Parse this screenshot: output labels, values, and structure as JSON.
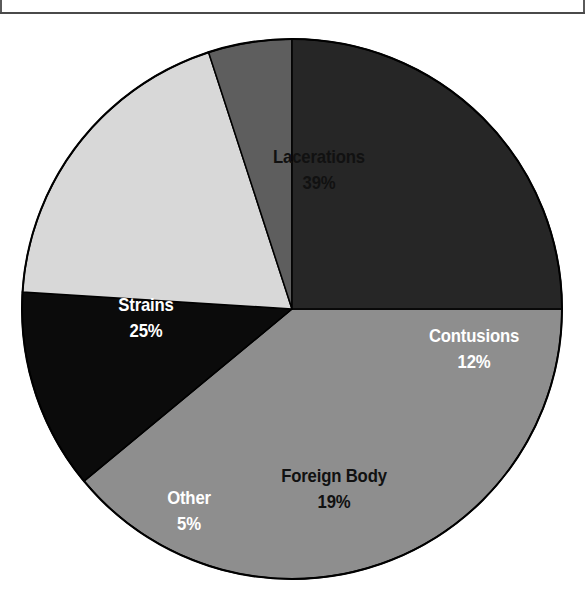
{
  "page": {
    "background_color": "#ffffff",
    "rule_color": "#4a4a4a"
  },
  "chart_data": {
    "type": "pie",
    "title": "",
    "subtitle": "",
    "xlabel": "",
    "ylabel": "",
    "legend_position": "none",
    "grid": false,
    "labels_inside_slices": true,
    "categories": [
      "Lacerations",
      "Contusions",
      "Foreign Body",
      "Other",
      "Strains"
    ],
    "values": [
      39,
      12,
      19,
      5,
      25
    ],
    "value_unit": "%",
    "start_angle_deg": 0,
    "direction": "clockwise",
    "slices": [
      {
        "name": "Lacerations",
        "value": 39,
        "label": "Lacerations",
        "value_label": "39%",
        "color": "#8e8e8e",
        "text_color": "#111111",
        "text_style": "dark"
      },
      {
        "name": "Contusions",
        "value": 12,
        "label": "Contusions",
        "value_label": "12%",
        "color": "#0b0b0b",
        "text_color": "#ffffff",
        "text_style": "light"
      },
      {
        "name": "Foreign Body",
        "value": 19,
        "label": "Foreign Body",
        "value_label": "19%",
        "color": "#d8d8d8",
        "text_color": "#111111",
        "text_style": "dark"
      },
      {
        "name": "Other",
        "value": 5,
        "label": "Other",
        "value_label": "5%",
        "color": "#5e5e5e",
        "text_color": "#ffffff",
        "text_style": "light"
      },
      {
        "name": "Strains",
        "value": 25,
        "label": "Strains",
        "value_label": "25%",
        "color": "#262626",
        "text_color": "#ffffff",
        "text_style": "light"
      }
    ],
    "geometry": {
      "center_x": 292,
      "center_y": 309,
      "radius": 270,
      "outline_color": "#000000",
      "outline_width": 2
    },
    "label_positions": [
      {
        "name": "Lacerations",
        "x": 319,
        "y": 170
      },
      {
        "name": "Contusions",
        "x": 474,
        "y": 349
      },
      {
        "name": "Foreign Body",
        "x": 334,
        "y": 489
      },
      {
        "name": "Other",
        "x": 189,
        "y": 511
      },
      {
        "name": "Strains",
        "x": 146,
        "y": 318
      }
    ]
  }
}
